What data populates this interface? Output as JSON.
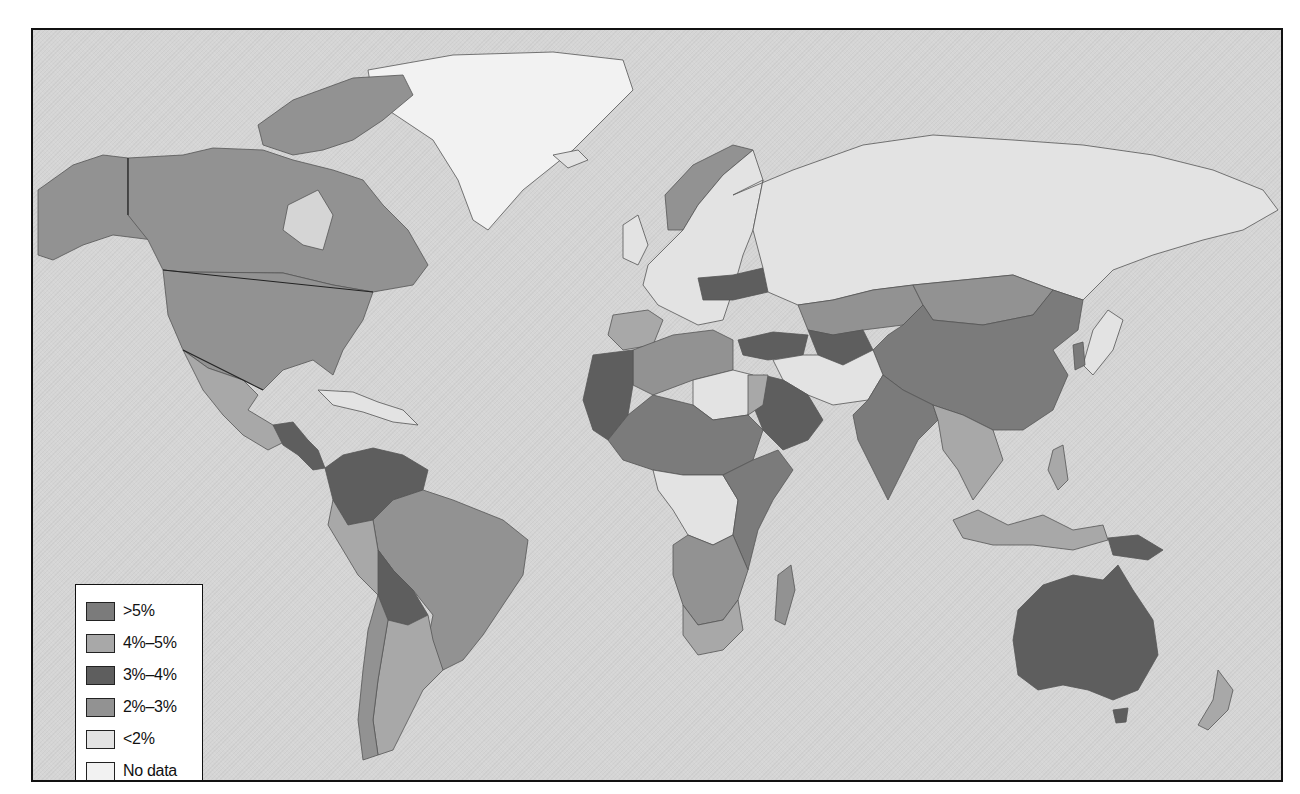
{
  "map": {
    "type": "choropleth",
    "projection": "world, Miller-like",
    "ocean_color": "#d5d5d5",
    "frame_border_color": "#111111"
  },
  "legend": {
    "items": [
      {
        "label": ">5%",
        "color": "#7b7b7b",
        "key": "gt5"
      },
      {
        "label": "4%–5%",
        "color": "#a8a8a8",
        "key": "r45"
      },
      {
        "label": "3%–4%",
        "color": "#5e5e5e",
        "key": "r34"
      },
      {
        "label": "2%–3%",
        "color": "#929292",
        "key": "r23"
      },
      {
        "label": "<2%",
        "color": "#e3e3e3",
        "key": "lt2"
      },
      {
        "label": "No data",
        "color": "#f2f2f2",
        "key": "nodata"
      }
    ]
  },
  "regions": [
    {
      "name": "Canada",
      "class": "r23"
    },
    {
      "name": "United States",
      "class": "r23"
    },
    {
      "name": "Alaska",
      "class": "r23"
    },
    {
      "name": "Greenland",
      "class": "nodata"
    },
    {
      "name": "Mexico",
      "class": "r45"
    },
    {
      "name": "Central America",
      "class": "r34"
    },
    {
      "name": "Caribbean",
      "class": "lt2"
    },
    {
      "name": "Colombia/Venezuela",
      "class": "r34"
    },
    {
      "name": "Brazil",
      "class": "r23"
    },
    {
      "name": "Peru",
      "class": "r45"
    },
    {
      "name": "Bolivia",
      "class": "r34"
    },
    {
      "name": "Chile",
      "class": "r23"
    },
    {
      "name": "Argentina",
      "class": "r45"
    },
    {
      "name": "Russia",
      "class": "lt2"
    },
    {
      "name": "Western Europe",
      "class": "lt2"
    },
    {
      "name": "Norway",
      "class": "r23"
    },
    {
      "name": "Poland/Belarus",
      "class": "r34"
    },
    {
      "name": "Spain",
      "class": "r45"
    },
    {
      "name": "Turkey",
      "class": "r34"
    },
    {
      "name": "Kazakhstan",
      "class": "r23"
    },
    {
      "name": "Mongolia",
      "class": "r23"
    },
    {
      "name": "China",
      "class": "gt5"
    },
    {
      "name": "India",
      "class": "gt5"
    },
    {
      "name": "Southeast Asia",
      "class": "r45"
    },
    {
      "name": "Japan",
      "class": "lt2"
    },
    {
      "name": "Saudi Arabia",
      "class": "r34"
    },
    {
      "name": "Iran/Afghanistan",
      "class": "lt2"
    },
    {
      "name": "North Africa",
      "class": "r23"
    },
    {
      "name": "Libya",
      "class": "lt2"
    },
    {
      "name": "Egypt",
      "class": "r45"
    },
    {
      "name": "Morocco/Mauritania",
      "class": "r34"
    },
    {
      "name": "Sahel",
      "class": "gt5"
    },
    {
      "name": "Central Africa",
      "class": "lt2"
    },
    {
      "name": "East Africa",
      "class": "gt5"
    },
    {
      "name": "Southern Africa",
      "class": "r23"
    },
    {
      "name": "South Africa",
      "class": "r45"
    },
    {
      "name": "Madagascar",
      "class": "r23"
    },
    {
      "name": "Indonesia",
      "class": "r45"
    },
    {
      "name": "Papua New Guinea",
      "class": "r34"
    },
    {
      "name": "Australia",
      "class": "r34"
    },
    {
      "name": "New Zealand",
      "class": "r45"
    }
  ]
}
